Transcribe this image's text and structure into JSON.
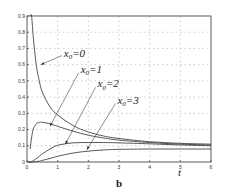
{
  "panel_label": "b",
  "chart_data": {
    "type": "line",
    "title": "",
    "xlabel": "t",
    "ylabel": "",
    "xlim": [
      0,
      6
    ],
    "ylim": [
      0,
      0.9
    ],
    "grid": true,
    "x_ticks": [
      "0",
      "1",
      "2",
      "3",
      "4",
      "5",
      "6"
    ],
    "y_ticks": [
      "0",
      "0.1",
      "0.2",
      "0.3",
      "0.4",
      "0.5",
      "0.6",
      "0.7",
      "0.8",
      "0.9"
    ],
    "x": [
      0.05,
      0.1,
      0.15,
      0.2,
      0.3,
      0.4,
      0.5,
      0.75,
      1.0,
      1.5,
      2.0,
      2.5,
      3.0,
      4.0,
      5.0,
      6.0
    ],
    "series": [
      {
        "name": "x0=0",
        "label_text": "x",
        "label_sub": "0",
        "label_val": "=0",
        "values": [
          null,
          0.9,
          0.9,
          0.78,
          0.6,
          0.5,
          0.43,
          0.34,
          0.29,
          0.225,
          0.185,
          0.16,
          0.145,
          0.125,
          0.115,
          0.11
        ]
      },
      {
        "name": "x0=1",
        "label_text": "x",
        "label_sub": "0",
        "label_val": "=1",
        "values": [
          null,
          0.08,
          0.15,
          0.2,
          0.235,
          0.244,
          0.245,
          0.235,
          0.22,
          0.19,
          0.165,
          0.148,
          0.135,
          0.12,
          0.11,
          0.105
        ]
      },
      {
        "name": "x0=2",
        "label_text": "x",
        "label_sub": "0",
        "label_val": "=2",
        "values": [
          0,
          0,
          0.002,
          0.008,
          0.02,
          0.035,
          0.05,
          0.08,
          0.103,
          0.118,
          0.12,
          0.12,
          0.118,
          0.112,
          0.105,
          0.1
        ]
      },
      {
        "name": "x0=3",
        "label_text": "x",
        "label_sub": "0",
        "label_val": "=3",
        "values": [
          0,
          0,
          0,
          0,
          0.002,
          0.005,
          0.01,
          0.022,
          0.035,
          0.055,
          0.067,
          0.074,
          0.078,
          0.08,
          0.08,
          0.08
        ]
      }
    ],
    "annotations": [
      {
        "series": "x0=0",
        "text_pos": [
          1.2,
          0.65
        ],
        "arrow_to": [
          0.45,
          0.6
        ]
      },
      {
        "series": "x0=1",
        "text_pos": [
          1.75,
          0.55
        ],
        "arrow_to": [
          0.75,
          0.22
        ]
      },
      {
        "series": "x0=2",
        "text_pos": [
          2.3,
          0.46
        ],
        "arrow_to": [
          1.25,
          0.11
        ]
      },
      {
        "series": "x0=3",
        "text_pos": [
          2.95,
          0.36
        ],
        "arrow_to": [
          1.95,
          0.075
        ]
      }
    ]
  }
}
